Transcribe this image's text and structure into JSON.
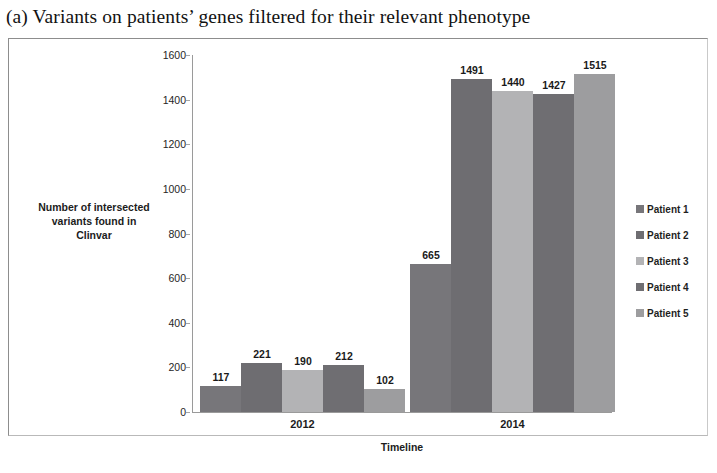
{
  "figure": {
    "caption": "(a) Variants on patients’ genes filtered for their relevant phenotype"
  },
  "chart_data": {
    "type": "bar",
    "title": "",
    "categories": [
      "2012",
      "2014"
    ],
    "series": [
      {
        "name": "Patient 1",
        "values": [
          117,
          665
        ],
        "color": "#77767a"
      },
      {
        "name": "Patient 2",
        "values": [
          221,
          1491
        ],
        "color": "#6e6d71"
      },
      {
        "name": "Patient 3",
        "values": [
          190,
          1440
        ],
        "color": "#b3b3b5"
      },
      {
        "name": "Patient 4",
        "values": [
          212,
          1427
        ],
        "color": "#6f6e72"
      },
      {
        "name": "Patient 5",
        "values": [
          102,
          1515
        ],
        "color": "#9d9d9f"
      }
    ],
    "xlabel": "Timeline",
    "ylabel": "Number of intersected variants found in Clinvar",
    "ylabel_lines": [
      "Number of intersected",
      "variants found in",
      "Clinvar"
    ],
    "ylim": [
      0,
      1600
    ],
    "yticks": [
      0,
      200,
      400,
      600,
      800,
      1000,
      1200,
      1400,
      1600
    ],
    "ytick_labels": [
      "0",
      "200",
      "400",
      "600",
      "800",
      "1000",
      "1200",
      "1400",
      "1600"
    ],
    "grid": false,
    "legend_position": "right",
    "data_labels": true
  }
}
